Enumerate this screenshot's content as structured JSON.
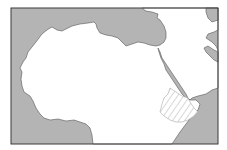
{
  "map": {
    "title": "",
    "region": "North Africa and Middle East",
    "colors": {
      "background": "#ffffff",
      "water": "#b4b4b4",
      "land": "#ffffff",
      "border": "#3a3a3a",
      "hatch": "#b0b0b0"
    },
    "highlighted_region": {
      "name": "Ethiopia",
      "style": "diagonal-hatch"
    }
  }
}
